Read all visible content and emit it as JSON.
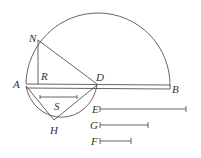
{
  "diagram": {
    "points": {
      "A": {
        "label": "A",
        "x": 26,
        "y": 84
      },
      "B": {
        "label": "B",
        "x": 170,
        "y": 87
      },
      "D": {
        "label": "D",
        "x": 97,
        "y": 84
      },
      "N": {
        "label": "N",
        "x": 38,
        "y": 40
      },
      "R": {
        "label": "R",
        "x": 38,
        "y": 84
      },
      "H": {
        "label": "H",
        "x": 54,
        "y": 120
      },
      "S": {
        "label": "S"
      },
      "E": {
        "label": "E"
      },
      "G": {
        "label": "G"
      },
      "F": {
        "label": "F"
      }
    },
    "segments": [
      {
        "name": "E",
        "length_px": 86
      },
      {
        "name": "G",
        "length_px": 48
      },
      {
        "name": "F",
        "length_px": 31
      },
      {
        "name": "S",
        "length_px": 37
      }
    ],
    "stroke_color": "#555555",
    "background": "#ffffff"
  }
}
